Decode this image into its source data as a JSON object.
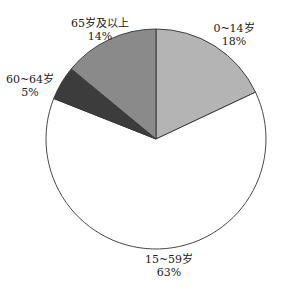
{
  "chart_data": {
    "type": "pie",
    "title": "",
    "start_angle_deg": -90,
    "direction": "clockwise",
    "center": [
      156,
      139
    ],
    "radius": 110,
    "slices": [
      {
        "label": "0~14岁",
        "value": 18,
        "value_label": "18%",
        "color": "#b4b4b4",
        "label_pos": [
          234,
          22
        ]
      },
      {
        "label": "15~59岁",
        "value": 63,
        "value_label": "63%",
        "color": "#ffffff",
        "label_pos": [
          169,
          253
        ]
      },
      {
        "label": "60~64岁",
        "value": 5,
        "value_label": "5%",
        "color": "#3c3c3c",
        "label_pos": [
          30,
          73
        ]
      },
      {
        "label": "65岁及以上",
        "value": 14,
        "value_label": "14%",
        "color": "#8a8a8a",
        "label_pos": [
          100,
          17
        ]
      }
    ],
    "categories": [
      "0~14岁",
      "15~59岁",
      "60~64岁",
      "65岁及以上"
    ],
    "values": [
      18,
      63,
      5,
      14
    ],
    "units": "%",
    "legend": "none",
    "stroke_color": "#333333"
  }
}
